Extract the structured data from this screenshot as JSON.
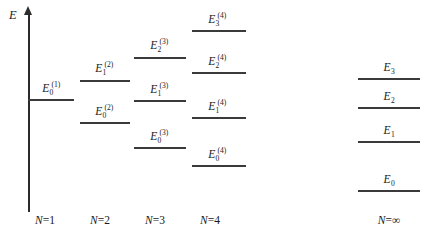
{
  "figure": {
    "type": "energy-level-diagram",
    "axis": {
      "label": "E",
      "name": "energy-axis",
      "x": 28,
      "top": 14,
      "bottom": 212
    },
    "columns": [
      {
        "id": "n1",
        "caption_prefix": "N",
        "caption_eq": "=",
        "caption_value": "1",
        "caption_x": 45,
        "line_x": 28,
        "line_width": 46,
        "levels": [
          {
            "base": "E",
            "sub": "0",
            "sup": "(1)",
            "y": 99,
            "label_x": 52,
            "label_y": 83
          }
        ]
      },
      {
        "id": "n2",
        "caption_prefix": "N",
        "caption_eq": "=",
        "caption_value": "2",
        "caption_x": 100,
        "line_x": 80,
        "line_width": 50,
        "levels": [
          {
            "base": "E",
            "sub": "1",
            "sup": "(2)",
            "y": 80,
            "label_x": 105,
            "label_y": 63
          },
          {
            "base": "E",
            "sub": "0",
            "sup": "(2)",
            "y": 122,
            "label_x": 105,
            "label_y": 106
          }
        ]
      },
      {
        "id": "n3",
        "caption_prefix": "N",
        "caption_eq": "=",
        "caption_value": "3",
        "caption_x": 155,
        "line_x": 134,
        "line_width": 52,
        "levels": [
          {
            "base": "E",
            "sub": "2",
            "sup": "(3)",
            "y": 57,
            "label_x": 160,
            "label_y": 40
          },
          {
            "base": "E",
            "sub": "1",
            "sup": "(3)",
            "y": 100,
            "label_x": 160,
            "label_y": 84
          },
          {
            "base": "E",
            "sub": "0",
            "sup": "(3)",
            "y": 147,
            "label_x": 160,
            "label_y": 131
          }
        ]
      },
      {
        "id": "n4",
        "caption_prefix": "N",
        "caption_eq": "=",
        "caption_value": "4",
        "caption_x": 210,
        "line_x": 192,
        "line_width": 54,
        "levels": [
          {
            "base": "E",
            "sub": "3",
            "sup": "(4)",
            "y": 30,
            "label_x": 218,
            "label_y": 14
          },
          {
            "base": "E",
            "sub": "2",
            "sup": "(4)",
            "y": 72,
            "label_x": 218,
            "label_y": 56
          },
          {
            "base": "E",
            "sub": "1",
            "sup": "(4)",
            "y": 117,
            "label_x": 218,
            "label_y": 101
          },
          {
            "base": "E",
            "sub": "0",
            "sup": "(4)",
            "y": 165,
            "label_x": 218,
            "label_y": 149
          }
        ]
      },
      {
        "id": "ninf",
        "caption_prefix": "N",
        "caption_eq": "=",
        "caption_value": "∞",
        "caption_x": 389,
        "line_x": 358,
        "line_width": 62,
        "levels": [
          {
            "base": "E",
            "sub": "3",
            "sup": "",
            "y": 78,
            "label_x": 389,
            "label_y": 62
          },
          {
            "base": "E",
            "sub": "2",
            "sup": "",
            "y": 107,
            "label_x": 389,
            "label_y": 91
          },
          {
            "base": "E",
            "sub": "1",
            "sup": "",
            "y": 141,
            "label_x": 389,
            "label_y": 125
          },
          {
            "base": "E",
            "sub": "0",
            "sup": "",
            "y": 190,
            "label_x": 389,
            "label_y": 174
          }
        ]
      }
    ],
    "colors": {
      "line": "#3a3a3a",
      "axis": "#2b2b2b",
      "text": "#1a1a1a",
      "background": "#ffffff"
    }
  },
  "chart_data": {
    "type": "scatter",
    "title": "",
    "xlabel": "",
    "ylabel": "E",
    "grid": false,
    "legend_position": "none",
    "categories": [
      "N=1",
      "N=2",
      "N=3",
      "N=4",
      "N=∞"
    ],
    "note": "Energy eigenvalue ladders; vertical position encodes energy (higher = greater E). Values below are pixel y-positions of each level line (smaller y = higher energy).",
    "series": [
      {
        "name": "N=1",
        "levels": [
          "E_0^(1)"
        ],
        "y_px": [
          99
        ]
      },
      {
        "name": "N=2",
        "levels": [
          "E_1^(2)",
          "E_0^(2)"
        ],
        "y_px": [
          80,
          122
        ]
      },
      {
        "name": "N=3",
        "levels": [
          "E_2^(3)",
          "E_1^(3)",
          "E_0^(3)"
        ],
        "y_px": [
          57,
          100,
          147
        ]
      },
      {
        "name": "N=4",
        "levels": [
          "E_3^(4)",
          "E_2^(4)",
          "E_1^(4)",
          "E_0^(4)"
        ],
        "y_px": [
          30,
          72,
          117,
          165
        ]
      },
      {
        "name": "N=∞",
        "levels": [
          "E_3",
          "E_2",
          "E_1",
          "E_0"
        ],
        "y_px": [
          78,
          107,
          141,
          190
        ]
      }
    ]
  }
}
